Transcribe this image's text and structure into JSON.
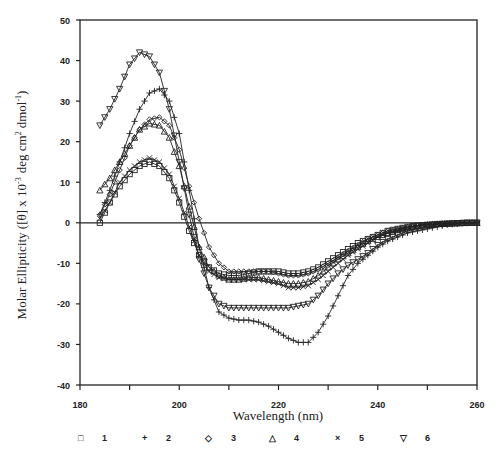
{
  "chart_data": {
    "type": "line",
    "title": "",
    "xlabel": "Wavelength (nm)",
    "ylabel": "Molar Ellipticity ([θ]) x 10^-3 deg cm^2 dmol^-1",
    "xlim": [
      180,
      260
    ],
    "ylim": [
      -40,
      50
    ],
    "x_ticks": [
      180,
      200,
      220,
      240,
      260
    ],
    "x_minor_ticks": [
      190,
      210,
      230,
      250
    ],
    "y_ticks": [
      50,
      40,
      30,
      20,
      10,
      0,
      -10,
      -20,
      -30,
      -40
    ],
    "grid": false,
    "legend_position": "bottom",
    "x": [
      184,
      186,
      188,
      190,
      192,
      194,
      196,
      198,
      200,
      202,
      204,
      206,
      208,
      210,
      212,
      214,
      216,
      218,
      220,
      222,
      224,
      226,
      228,
      230,
      232,
      234,
      236,
      238,
      240,
      242,
      244,
      246,
      248,
      250,
      252,
      254,
      256,
      258,
      260
    ],
    "series": [
      {
        "name": "1",
        "marker": "square",
        "values": [
          0,
          5,
          9,
          12,
          14,
          15,
          14,
          11,
          5,
          -2,
          -8,
          -11,
          -12.5,
          -13,
          -13,
          -12.5,
          -12,
          -12,
          -12,
          -12.5,
          -12.5,
          -12,
          -11,
          -9.5,
          -8,
          -6.5,
          -5,
          -4,
          -3,
          -2,
          -1.5,
          -1,
          -0.7,
          -0.5,
          -0.3,
          -0.2,
          -0.1,
          0,
          0
        ]
      },
      {
        "name": "2",
        "marker": "plus",
        "values": [
          2,
          8,
          15,
          22,
          28,
          32,
          33,
          30,
          22,
          8,
          -6,
          -16,
          -22,
          -23.5,
          -24,
          -24,
          -24.5,
          -25.5,
          -27,
          -28.5,
          -29.5,
          -29.5,
          -27,
          -23,
          -18,
          -13,
          -10,
          -8,
          -6,
          -4.5,
          -3.5,
          -2.5,
          -2,
          -1.5,
          -1,
          -0.5,
          -0.3,
          -0.1,
          0
        ]
      },
      {
        "name": "3",
        "marker": "diamond",
        "values": [
          2,
          7,
          13,
          19,
          23,
          25.5,
          26,
          24,
          18,
          9,
          1,
          -6,
          -10,
          -12,
          -12,
          -12,
          -12,
          -12,
          -12.5,
          -13,
          -13,
          -12.5,
          -11.5,
          -10,
          -8.5,
          -7,
          -5.5,
          -4,
          -3,
          -2,
          -1.5,
          -1,
          -0.7,
          -0.5,
          -0.3,
          -0.2,
          -0.1,
          0,
          0
        ]
      },
      {
        "name": "4",
        "marker": "triangle-up",
        "values": [
          8,
          11,
          15,
          19,
          23,
          24.5,
          24,
          21,
          14,
          4,
          -6,
          -11,
          -13,
          -14,
          -14,
          -13.5,
          -13.5,
          -14,
          -14.5,
          -15,
          -15,
          -14.5,
          -13,
          -11,
          -9,
          -7.5,
          -6,
          -4.5,
          -3.5,
          -2.5,
          -1.8,
          -1.2,
          -0.8,
          -0.5,
          -0.3,
          -0.2,
          -0.1,
          0,
          0
        ]
      },
      {
        "name": "5",
        "marker": "x",
        "values": [
          1,
          5,
          10,
          13,
          15,
          16,
          15,
          12,
          6,
          -1,
          -8,
          -12,
          -13.5,
          -14,
          -14,
          -14,
          -14,
          -14.5,
          -15,
          -16,
          -16,
          -15.5,
          -14,
          -12,
          -10,
          -8,
          -6.5,
          -5,
          -3.5,
          -2.5,
          -1.8,
          -1.2,
          -0.8,
          -0.5,
          -0.3,
          -0.2,
          -0.1,
          0,
          0
        ]
      },
      {
        "name": "6",
        "marker": "triangle-down",
        "values": [
          24,
          28,
          33,
          39,
          42,
          41,
          37,
          28,
          15,
          2,
          -9,
          -16,
          -20,
          -21,
          -21,
          -21,
          -21,
          -21,
          -21,
          -21,
          -20.5,
          -20,
          -18,
          -15,
          -12.5,
          -10.5,
          -9,
          -7.5,
          -5.5,
          -4,
          -3,
          -2,
          -1.3,
          -0.8,
          -0.5,
          -0.3,
          -0.1,
          0,
          0
        ]
      }
    ]
  },
  "legend": [
    {
      "symbol": "□",
      "label": "1"
    },
    {
      "symbol": "+",
      "label": "2"
    },
    {
      "symbol": "◇",
      "label": "3"
    },
    {
      "symbol": "△",
      "label": "4"
    },
    {
      "symbol": "×",
      "label": "5"
    },
    {
      "symbol": "▽",
      "label": "6"
    }
  ],
  "axes": {
    "xlabel": "Wavelength  (nm)",
    "ylabel": "Molar Ellipticity ([θ] x 10",
    "ylabel_sup1": "-3",
    "ylabel_mid": "deg cm",
    "ylabel_sup2": "2",
    "ylabel_end": "dmol",
    "ylabel_sup3": "-1",
    "ylabel_close": ")"
  }
}
